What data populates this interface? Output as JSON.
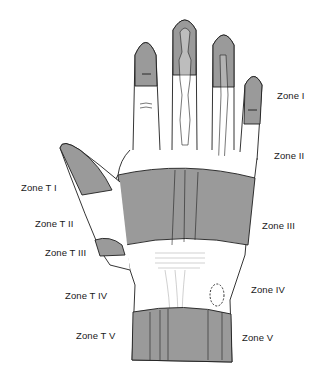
{
  "diagram": {
    "colors": {
      "shade": "#9a9a9a",
      "outline": "#1e1e1e",
      "background": "#ffffff"
    },
    "finger_zones": [
      {
        "id": "zone-1",
        "label": "Zone I"
      },
      {
        "id": "zone-2",
        "label": "Zone II"
      },
      {
        "id": "zone-3",
        "label": "Zone III"
      },
      {
        "id": "zone-4",
        "label": "Zone IV"
      },
      {
        "id": "zone-5",
        "label": "Zone V"
      }
    ],
    "thumb_zones": [
      {
        "id": "zone-t1",
        "label": "Zone T I"
      },
      {
        "id": "zone-t2",
        "label": "Zone T II"
      },
      {
        "id": "zone-t3",
        "label": "Zone T III"
      },
      {
        "id": "zone-t4",
        "label": "Zone T IV"
      },
      {
        "id": "zone-t5",
        "label": "Zone T V"
      }
    ]
  }
}
